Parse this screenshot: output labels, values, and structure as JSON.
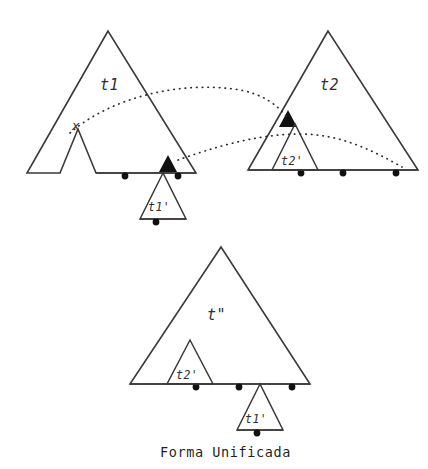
{
  "figure": {
    "caption": "Forma Unificada",
    "stroke_color": "#3a3a3a",
    "marker_color": "#111111",
    "background": "#ffffff"
  },
  "panels": {
    "source_left": {
      "label": "t1",
      "subtree_label": "t1'",
      "variable_label": "x",
      "leaf_count": 2,
      "substitution_marker": "filled-triangle"
    },
    "source_right": {
      "label": "t2",
      "subtree_label": "t2'",
      "leaf_count": 3,
      "substitution_marker": "filled-triangle"
    },
    "result": {
      "label": "t\"",
      "subtree_label_left": "t2'",
      "subtree_label_right": "t1'",
      "leaf_count": 3
    }
  },
  "links": [
    {
      "name": "x-to-t2-marker",
      "style": "dotted"
    },
    {
      "name": "t1-marker-to-t2-base",
      "style": "dotted"
    }
  ]
}
